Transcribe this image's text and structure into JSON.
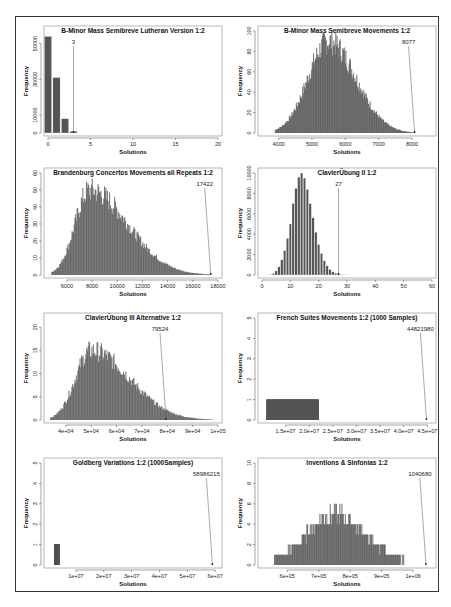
{
  "page": {
    "frame_color": "#333333",
    "bar_color": "#555555"
  },
  "chart_data": [
    {
      "type": "bar",
      "title": "B-Minor Mass Semibreve Lutheran Version 1:2",
      "xlabel": "Solutions",
      "ylabel": "Frequency",
      "xlim": [
        0,
        20
      ],
      "ylim": [
        0,
        57000
      ],
      "xticks": [
        "0",
        "5",
        "10",
        "15",
        "20"
      ],
      "yticks": [
        "0",
        "10000",
        "30000",
        "50000"
      ],
      "categories": [
        0,
        1,
        2,
        3
      ],
      "values": [
        54000,
        31000,
        8000,
        1000
      ],
      "annotation": {
        "label": "3",
        "x": 3
      }
    },
    {
      "type": "bar",
      "title": "B-Minor Mass Semibreve Movements 1:2",
      "xlabel": "Solutions",
      "ylabel": "Frequency",
      "xlim": [
        3500,
        8600
      ],
      "ylim": [
        0,
        100
      ],
      "xticks": [
        "4000",
        "5000",
        "6000",
        "7000",
        "8000"
      ],
      "yticks": [
        "0",
        "20",
        "40",
        "60",
        "80",
        "100"
      ],
      "distribution": {
        "shape": "right-skewed",
        "peak_x": 5500,
        "peak_y": 90,
        "min_x": 3900,
        "max_x": 8100
      },
      "annotation": {
        "label": "8077",
        "x": 8077
      }
    },
    {
      "type": "bar",
      "title": "Brandenburg Concertos Movements all Repeats 1:2",
      "xlabel": "Solutions",
      "ylabel": "Frequency",
      "xlim": [
        4500,
        18000
      ],
      "ylim": [
        0,
        60
      ],
      "xticks": [
        "6000",
        "8000",
        "10000",
        "12000",
        "14000",
        "16000",
        "18000"
      ],
      "yticks": [
        "0",
        "10",
        "20",
        "30",
        "40",
        "50",
        "60"
      ],
      "distribution": {
        "shape": "right-skewed",
        "peak_x": 7800,
        "peak_y": 50,
        "min_x": 4800,
        "max_x": 17422
      },
      "annotation": {
        "label": "17422",
        "x": 17422
      }
    },
    {
      "type": "bar",
      "title": "ClavierÜbung II 1:2",
      "xlabel": "Solutions",
      "ylabel": "Frequency",
      "xlim": [
        0,
        60
      ],
      "ylim": [
        0,
        10000
      ],
      "xticks": [
        "0",
        "10",
        "20",
        "30",
        "40",
        "50",
        "60"
      ],
      "yticks": [
        "0",
        "2000",
        "4000",
        "6000",
        "8000",
        "10000"
      ],
      "categories": [
        3,
        4,
        5,
        6,
        7,
        8,
        9,
        10,
        11,
        12,
        13,
        14,
        15,
        16,
        17,
        18,
        19,
        20,
        21,
        22,
        23,
        24,
        25,
        26,
        27,
        28,
        29,
        30
      ],
      "values": [
        50,
        150,
        400,
        800,
        1500,
        2400,
        3600,
        5000,
        7000,
        8500,
        9600,
        10000,
        9500,
        8400,
        7000,
        5600,
        4200,
        3000,
        2100,
        1400,
        900,
        550,
        320,
        180,
        100,
        50,
        25,
        10
      ],
      "annotation": {
        "label": "27",
        "x": 27
      }
    },
    {
      "type": "bar",
      "title": "ClavierÜbung III Alternative 1:2",
      "xlabel": "Solutions",
      "ylabel": "Frequency",
      "xlim": [
        33000,
        100000
      ],
      "ylim": [
        0,
        22
      ],
      "xticks": [
        "4e+04",
        "5e+04",
        "6e+04",
        "7e+04",
        "8e+04",
        "9e+04",
        "1e+05"
      ],
      "yticks": [
        "0",
        "5",
        "10",
        "15",
        "20"
      ],
      "distribution": {
        "shape": "right-skewed",
        "peak_x": 50000,
        "peak_y": 15,
        "min_x": 34000,
        "max_x": 98000
      },
      "annotation": {
        "label": "79524",
        "x": 79524
      }
    },
    {
      "type": "bar",
      "title": "French Suites Movements 1:2 (1000 Samples)",
      "xlabel": "Solutions",
      "ylabel": "Frequency",
      "xlim": [
        10000000,
        46000000
      ],
      "ylim": [
        0,
        5
      ],
      "xticks": [
        "1.5e+07",
        "2.0e+07",
        "2.5e+07",
        "3.0e+07",
        "3.5e+07",
        "4.0e+07",
        "4.5e+07"
      ],
      "yticks": [
        "0",
        "1",
        "2",
        "3",
        "4",
        "5"
      ],
      "distribution": {
        "shape": "uniform-band",
        "min_x": 11000000,
        "max_x": 22000000,
        "height": 1
      },
      "annotation": {
        "label": "44821980",
        "x": 44821980
      }
    },
    {
      "type": "bar",
      "title": "Goldberg Variations 1:2 (1000Samples)",
      "xlabel": "Solutions",
      "ylabel": "Frequency",
      "xlim": [
        0,
        61000000
      ],
      "ylim": [
        0,
        5
      ],
      "xticks": [
        "1e+07",
        "2e+07",
        "3e+07",
        "4e+07",
        "5e+07",
        "6e+07"
      ],
      "yticks": [
        "0",
        "1",
        "2",
        "3",
        "4",
        "5"
      ],
      "distribution": {
        "shape": "narrow-band",
        "min_x": 2500000,
        "max_x": 4000000,
        "height": 1
      },
      "annotation": {
        "label": "58986215",
        "x": 58986215
      }
    },
    {
      "type": "bar",
      "title": "Inventions & Sinfonias 1:2",
      "xlabel": "Solutions",
      "ylabel": "Frequency",
      "xlim": [
        520000,
        1060000
      ],
      "ylim": [
        0,
        10
      ],
      "xticks": [
        "6e+05",
        "7e+05",
        "8e+05",
        "9e+05",
        "1e+06"
      ],
      "yticks": [
        "0",
        "2",
        "4",
        "6",
        "8",
        "10"
      ],
      "distribution": {
        "shape": "symmetric-stepped",
        "peak_x": 750000,
        "peak_y": 5,
        "min_x": 560000,
        "max_x": 1040000
      },
      "annotation": {
        "label": "1040680",
        "x": 1040680
      }
    }
  ]
}
